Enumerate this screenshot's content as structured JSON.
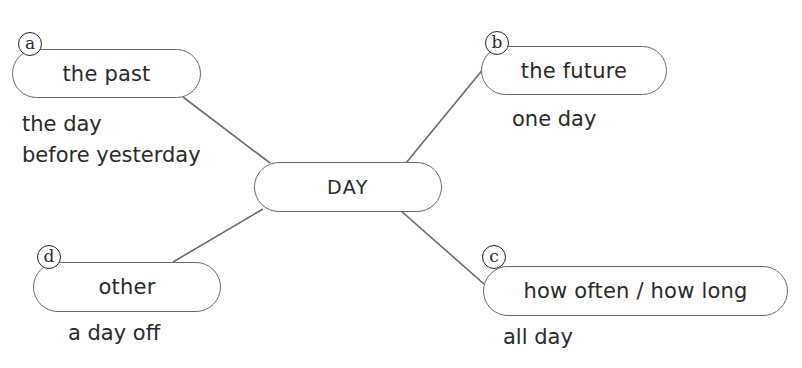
{
  "diagram": {
    "type": "mind-map",
    "center": {
      "label": "DAY"
    },
    "branches": [
      {
        "id": "a",
        "badge": "a",
        "label": "the past",
        "examples": [
          "the day",
          "before yesterday"
        ]
      },
      {
        "id": "b",
        "badge": "b",
        "label": "the future",
        "examples": [
          "one day"
        ]
      },
      {
        "id": "c",
        "badge": "c",
        "label": "how often / how long",
        "examples": [
          "all day"
        ]
      },
      {
        "id": "d",
        "badge": "d",
        "label": "other",
        "examples": [
          "a day off"
        ]
      }
    ]
  },
  "colors": {
    "outline": "#6a6a6a",
    "text": "#2a2a2a",
    "badge_border": "#222222",
    "background": "#ffffff"
  }
}
